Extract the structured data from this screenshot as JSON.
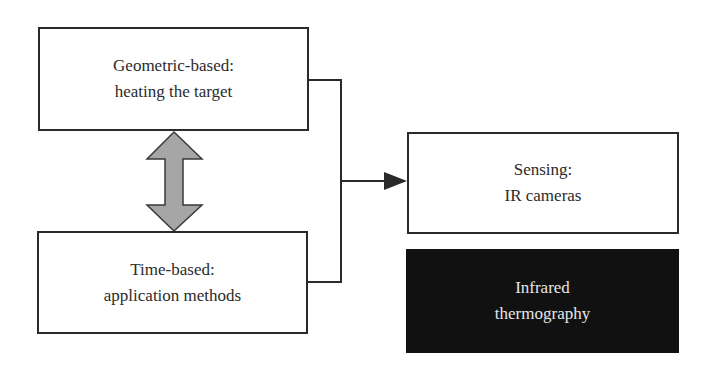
{
  "diagram": {
    "boxes": {
      "geometric": {
        "line1": "Geometric-based:",
        "line2": "heating the target"
      },
      "time": {
        "line1": "Time-based:",
        "line2": "application methods"
      },
      "sensing": {
        "line1": "Sensing:",
        "line2": "IR cameras"
      },
      "infrared": {
        "line1": "Infrared",
        "line2": "thermography"
      }
    },
    "colors": {
      "border": "#2a2a2a",
      "double_arrow_fill": "#a6a6a6",
      "dark_box_fill": "#111111",
      "dark_box_text": "#e6e6e6"
    }
  }
}
